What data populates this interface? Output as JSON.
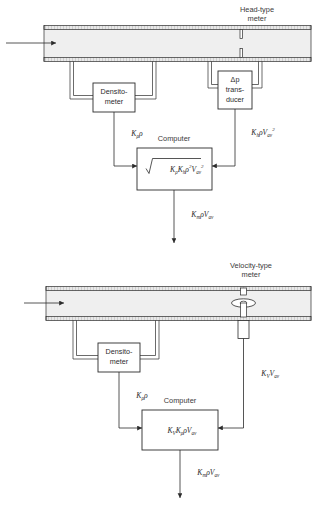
{
  "figure": {
    "type": "engineering-block-diagram"
  },
  "colors": {
    "line": "#2b2b2b",
    "pipe_fill": "#efefef",
    "pipe_wall": "#d6d6d6",
    "background": "#ffffff",
    "text": "#2b2b2b"
  },
  "top_diagram": {
    "title_line1": "Head-type",
    "title_line2": "meter",
    "pipe": {
      "flow_arrow": "flow-arrow-right",
      "restriction": "orifice-plate"
    },
    "densitometer": {
      "line1": "Densito-",
      "line2": "meter"
    },
    "transducer": {
      "line1": "Δp",
      "line2": "trans-",
      "line3": "ducer"
    },
    "computer": {
      "label": "Computer",
      "formula_plain": "sqrt( Kρ Kh ρ² Vav² )",
      "formula_parts": {
        "radical": "√",
        "t1": "K",
        "t1sub": "ρ",
        "t2": "K",
        "t2sub": "h",
        "t3": "ρ",
        "t3sup": "2",
        "t4": "V",
        "t4sub": "av",
        "t4sup": "2"
      }
    },
    "signal_left": {
      "main": "K",
      "sub": "ρ",
      "tail": "ρ",
      "plain": "Kρ ρ"
    },
    "signal_right": {
      "main": "K",
      "sub": "h",
      "mid": "ρV",
      "sub2": "av",
      "sup2": "2",
      "plain": "Kh ρ Vav²"
    },
    "output": {
      "main": "K",
      "sub": "m",
      "mid": "ρV",
      "sub2": "av",
      "plain": "Km ρ Vav"
    }
  },
  "bottom_diagram": {
    "title_line1": "Velocity-type",
    "title_line2": "meter",
    "pipe": {
      "flow_arrow": "flow-arrow-right",
      "sensor": "turbine-rotor-with-pickup"
    },
    "densitometer": {
      "line1": "Densito-",
      "line2": "meter"
    },
    "computer": {
      "label": "Computer",
      "formula_plain": "KV Kρ ρ Vav",
      "formula_parts": {
        "t1": "K",
        "t1sub": "V",
        "t2": "K",
        "t2sub": "ρ",
        "t3": "ρ",
        "t4": "V",
        "t4sub": "av"
      }
    },
    "signal_left": {
      "main": "K",
      "sub": "ρ",
      "tail": "ρ",
      "plain": "Kρ ρ"
    },
    "signal_right": {
      "main": "K",
      "sub": "V",
      "mid": "V",
      "sub2": "av",
      "plain": "KV Vav"
    },
    "output": {
      "main": "K",
      "sub": "m",
      "mid": "ρV",
      "sub2": "av",
      "plain": "Km ρ Vav"
    }
  }
}
